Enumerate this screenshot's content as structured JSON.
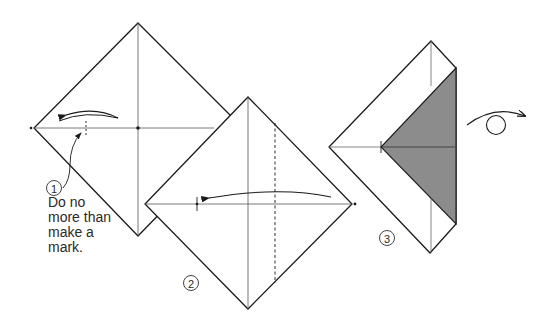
{
  "figure": {
    "steps": [
      {
        "number": "1",
        "symbol": "①",
        "instruction": "Do no\nmore than\nmake a\nmark."
      },
      {
        "number": "2",
        "symbol": "②"
      },
      {
        "number": "3",
        "symbol": "③"
      }
    ],
    "turn_over_symbol": "turn-over arrow",
    "colors": {
      "line": "#1a1a1a",
      "shade": "#8c8c8c",
      "crease": "#555555"
    }
  }
}
